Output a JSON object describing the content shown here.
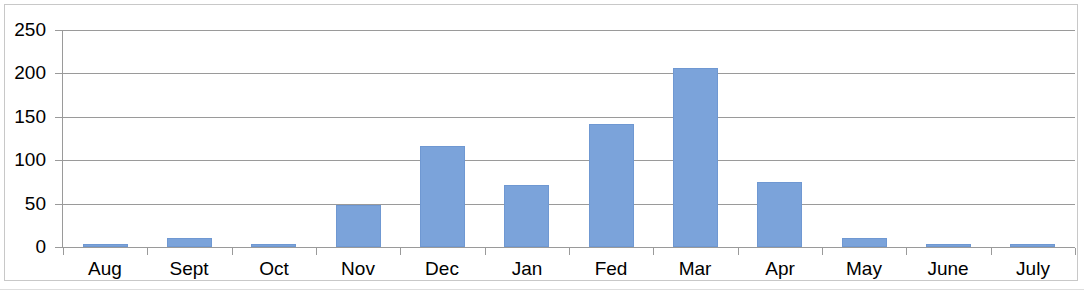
{
  "chart_data": {
    "type": "bar",
    "title": "",
    "subtitle": "",
    "xlabel": "",
    "ylabel": "",
    "categories": [
      "Aug",
      "Sept",
      "Oct",
      "Nov",
      "Dec",
      "Jan",
      "Fed",
      "Mar",
      "Apr",
      "May",
      "June",
      "July"
    ],
    "values": [
      4,
      10,
      3,
      48,
      116,
      71,
      142,
      206,
      75,
      10,
      4,
      4
    ],
    "series": [
      {
        "name": "",
        "values": [
          4,
          10,
          3,
          48,
          116,
          71,
          142,
          206,
          75,
          10,
          4,
          4
        ]
      }
    ],
    "ylim": [
      0,
      250
    ],
    "ytick_labels": [
      "0",
      "50",
      "100",
      "150",
      "200",
      "250"
    ],
    "ytick_values": [
      0,
      50,
      100,
      150,
      200,
      250
    ],
    "grid": true,
    "grid_axis": "y",
    "legend": false,
    "legend_position": "none",
    "bar_color": "#7ba3da",
    "bar_border_color": "#6f98d2",
    "gridline_color": "#9a9a9a",
    "axis_color": "#9a9a9a",
    "plot_background": "#ffffff",
    "frame_color": "#c8c8c8"
  }
}
